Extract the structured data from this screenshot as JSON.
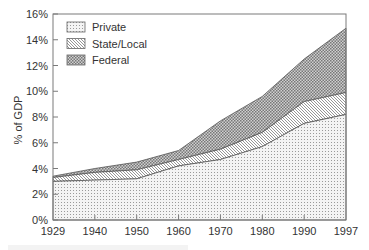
{
  "chart_data": {
    "type": "area",
    "stacked": true,
    "title": "",
    "xlabel": "",
    "ylabel": "% of GDP",
    "categories": [
      "1929",
      "1940",
      "1950",
      "1960",
      "1970",
      "1980",
      "1990",
      "1997"
    ],
    "series": [
      {
        "name": "Private",
        "pattern": "dots",
        "values": [
          3.0,
          3.1,
          3.2,
          4.2,
          4.7,
          5.7,
          7.5,
          8.2
        ]
      },
      {
        "name": "State/Local",
        "pattern": "diagonal",
        "values": [
          0.3,
          0.6,
          0.7,
          0.5,
          0.8,
          1.1,
          1.7,
          1.7
        ]
      },
      {
        "name": "Federal",
        "pattern": "checker",
        "values": [
          0.1,
          0.3,
          0.6,
          0.7,
          2.2,
          2.8,
          3.3,
          5.0
        ]
      }
    ],
    "cumulative_tops": {
      "Private": [
        3.0,
        3.1,
        3.2,
        4.2,
        4.7,
        5.7,
        7.5,
        8.2
      ],
      "State/Local": [
        3.3,
        3.7,
        3.9,
        4.7,
        5.5,
        6.8,
        9.2,
        9.9
      ],
      "Federal": [
        3.4,
        4.0,
        4.5,
        5.4,
        7.7,
        9.6,
        12.5,
        14.9
      ]
    },
    "ylim": [
      0,
      16
    ],
    "yticks": [
      "0%",
      "2%",
      "4%",
      "6%",
      "8%",
      "10%",
      "12%",
      "14%",
      "16%"
    ],
    "grid": false,
    "legend_position": "upper-left-inside"
  },
  "colors": {
    "axis": "#7a7a7a",
    "outline": "#555555",
    "dots": "#9a9a9a",
    "hatch": "#8a8a8a",
    "checker_dark": "#7c7c7c",
    "checker_light": "#d6d6d6"
  }
}
